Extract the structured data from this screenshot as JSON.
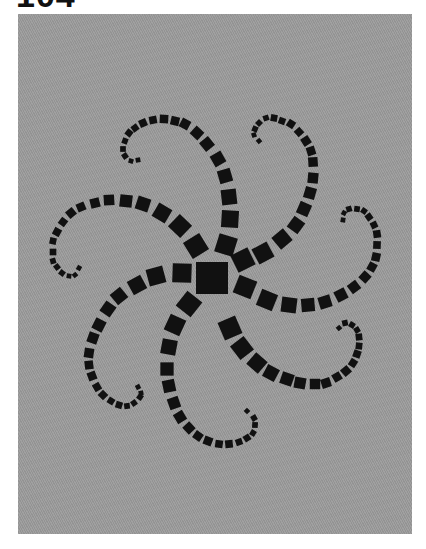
{
  "page": {
    "number_label": "104"
  },
  "panel": {
    "background_color": "#9b9b9b",
    "shape_color": "#111111"
  },
  "artwork": {
    "description": "Seven-armed spiral of black squares on gray textured background",
    "center": {
      "x": 212,
      "y": 278,
      "size": 32
    },
    "arms": [
      {
        "name": "top",
        "points": [
          [
            226,
            245,
            20
          ],
          [
            230,
            219,
            18
          ],
          [
            229,
            197,
            16
          ],
          [
            225,
            176,
            14
          ],
          [
            218,
            159,
            13
          ],
          [
            207,
            144,
            12
          ],
          [
            197,
            133,
            11
          ],
          [
            185,
            124,
            10
          ],
          [
            175,
            121,
            9
          ],
          [
            164,
            119,
            9
          ],
          [
            153,
            120,
            8
          ],
          [
            143,
            123,
            8
          ],
          [
            135,
            128,
            7
          ],
          [
            129,
            133,
            7
          ],
          [
            125,
            141,
            6
          ],
          [
            123,
            149,
            6
          ],
          [
            125,
            156,
            6
          ],
          [
            131,
            161,
            5
          ],
          [
            138,
            160,
            5
          ]
        ]
      },
      {
        "name": "upper-right",
        "points": [
          [
            243,
            260,
            20
          ],
          [
            263,
            253,
            18
          ],
          [
            282,
            239,
            16
          ],
          [
            296,
            225,
            14
          ],
          [
            304,
            209,
            13
          ],
          [
            310,
            193,
            12
          ],
          [
            313,
            178,
            11
          ],
          [
            313,
            162,
            10
          ],
          [
            311,
            151,
            9
          ],
          [
            306,
            141,
            9
          ],
          [
            299,
            132,
            8
          ],
          [
            291,
            124,
            8
          ],
          [
            282,
            121,
            7
          ],
          [
            274,
            118,
            7
          ],
          [
            266,
            118,
            6
          ],
          [
            259,
            123,
            6
          ],
          [
            255,
            129,
            6
          ],
          [
            254,
            135,
            5
          ],
          [
            259,
            141,
            5
          ]
        ]
      },
      {
        "name": "right",
        "points": [
          [
            245,
            287,
            20
          ],
          [
            267,
            300,
            18
          ],
          [
            289,
            305,
            16
          ],
          [
            308,
            305,
            14
          ],
          [
            325,
            302,
            13
          ],
          [
            341,
            295,
            12
          ],
          [
            354,
            287,
            11
          ],
          [
            365,
            277,
            10
          ],
          [
            372,
            267,
            9
          ],
          [
            376,
            257,
            9
          ],
          [
            377,
            245,
            8
          ],
          [
            377,
            234,
            8
          ],
          [
            374,
            225,
            7
          ],
          [
            369,
            217,
            7
          ],
          [
            364,
            211,
            6
          ],
          [
            357,
            209,
            6
          ],
          [
            349,
            209,
            6
          ],
          [
            344,
            213,
            5
          ],
          [
            343,
            220,
            5
          ]
        ]
      },
      {
        "name": "lower-right",
        "points": [
          [
            230,
            328,
            20
          ],
          [
            242,
            348,
            18
          ],
          [
            257,
            363,
            16
          ],
          [
            271,
            373,
            14
          ],
          [
            287,
            379,
            13
          ],
          [
            300,
            383,
            12
          ],
          [
            315,
            384,
            11
          ],
          [
            326,
            383,
            10
          ],
          [
            337,
            377,
            9
          ],
          [
            346,
            371,
            9
          ],
          [
            353,
            363,
            8
          ],
          [
            357,
            354,
            8
          ],
          [
            359,
            346,
            7
          ],
          [
            359,
            337,
            7
          ],
          [
            357,
            330,
            6
          ],
          [
            352,
            325,
            6
          ],
          [
            345,
            323,
            6
          ],
          [
            339,
            328,
            5
          ]
        ]
      },
      {
        "name": "lower",
        "points": [
          [
            189,
            304,
            20
          ],
          [
            175,
            325,
            18
          ],
          [
            169,
            347,
            16
          ],
          [
            167,
            369,
            14
          ],
          [
            169,
            386,
            13
          ],
          [
            174,
            403,
            12
          ],
          [
            180,
            417,
            11
          ],
          [
            189,
            428,
            10
          ],
          [
            198,
            436,
            9
          ],
          [
            208,
            441,
            9
          ],
          [
            219,
            444,
            8
          ],
          [
            229,
            444,
            8
          ],
          [
            239,
            442,
            7
          ],
          [
            247,
            438,
            7
          ],
          [
            253,
            433,
            6
          ],
          [
            255,
            425,
            6
          ],
          [
            254,
            418,
            6
          ],
          [
            247,
            411,
            5
          ]
        ]
      },
      {
        "name": "lower-left",
        "points": [
          [
            182,
            273,
            20
          ],
          [
            156,
            276,
            18
          ],
          [
            137,
            285,
            16
          ],
          [
            119,
            296,
            14
          ],
          [
            108,
            309,
            13
          ],
          [
            99,
            325,
            12
          ],
          [
            93,
            338,
            11
          ],
          [
            89,
            353,
            10
          ],
          [
            89,
            365,
            9
          ],
          [
            92,
            376,
            9
          ],
          [
            97,
            387,
            8
          ],
          [
            103,
            395,
            8
          ],
          [
            111,
            401,
            7
          ],
          [
            119,
            405,
            7
          ],
          [
            127,
            406,
            6
          ],
          [
            134,
            403,
            6
          ],
          [
            140,
            397,
            6
          ],
          [
            141,
            393,
            5
          ],
          [
            138,
            387,
            5
          ]
        ]
      },
      {
        "name": "upper-left",
        "points": [
          [
            196,
            246,
            20
          ],
          [
            180,
            226,
            18
          ],
          [
            162,
            213,
            16
          ],
          [
            143,
            204,
            14
          ],
          [
            126,
            201,
            13
          ],
          [
            109,
            200,
            11
          ],
          [
            95,
            203,
            10
          ],
          [
            81,
            207,
            9
          ],
          [
            71,
            213,
            9
          ],
          [
            63,
            222,
            8
          ],
          [
            57,
            232,
            8
          ],
          [
            53,
            241,
            7
          ],
          [
            53,
            252,
            7
          ],
          [
            53,
            261,
            6
          ],
          [
            57,
            267,
            6
          ],
          [
            62,
            273,
            6
          ],
          [
            69,
            276,
            5
          ],
          [
            75,
            275,
            5
          ],
          [
            79,
            268,
            5
          ]
        ]
      }
    ]
  }
}
